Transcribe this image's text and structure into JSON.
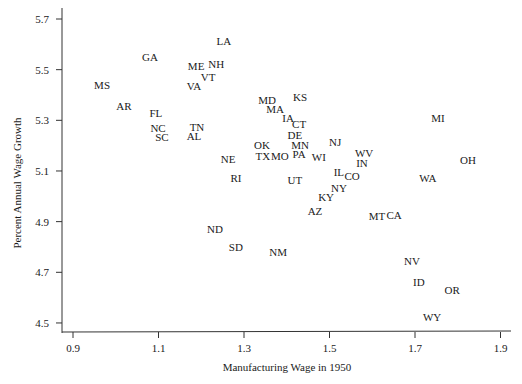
{
  "chart_data": {
    "type": "scatter",
    "title": "",
    "xlabel": "Manufacturing Wage in 1950",
    "ylabel": "Percent Annual Wage Growth",
    "xlim": [
      0.875,
      1.93
    ],
    "ylim": [
      4.46,
      5.74
    ],
    "x_ticks": [
      0.9,
      1.1,
      1.3,
      1.5,
      1.7,
      1.9
    ],
    "x_tick_labels": [
      "0.9",
      "1.1",
      "1.3",
      "1.5",
      "1.7",
      "1.9"
    ],
    "y_ticks": [
      5.7,
      5.5,
      5.3,
      5.1,
      4.9,
      4.7,
      4.5
    ],
    "y_tick_labels": [
      "5.7",
      "5.5",
      "5.3",
      "5.1",
      "4.9",
      "4.7",
      "4.5"
    ],
    "grid": false,
    "legend": null,
    "marker": "state-abbreviation text labels",
    "points": [
      {
        "label": "MS",
        "x": 0.968,
        "y": 5.44
      },
      {
        "label": "AR",
        "x": 1.019,
        "y": 5.357
      },
      {
        "label": "GA",
        "x": 1.08,
        "y": 5.55
      },
      {
        "label": "FL",
        "x": 1.094,
        "y": 5.329
      },
      {
        "label": "NC",
        "x": 1.099,
        "y": 5.27
      },
      {
        "label": "SC",
        "x": 1.108,
        "y": 5.234
      },
      {
        "label": "LA",
        "x": 1.253,
        "y": 5.613
      },
      {
        "label": "ME",
        "x": 1.188,
        "y": 5.514
      },
      {
        "label": "NH",
        "x": 1.235,
        "y": 5.522
      },
      {
        "label": "VT",
        "x": 1.216,
        "y": 5.471
      },
      {
        "label": "VA",
        "x": 1.183,
        "y": 5.435
      },
      {
        "label": "TN",
        "x": 1.19,
        "y": 5.274
      },
      {
        "label": "AL",
        "x": 1.183,
        "y": 5.238
      },
      {
        "label": "NE",
        "x": 1.263,
        "y": 5.147
      },
      {
        "label": "RI",
        "x": 1.281,
        "y": 5.072
      },
      {
        "label": "ND",
        "x": 1.232,
        "y": 4.871
      },
      {
        "label": "SD",
        "x": 1.281,
        "y": 4.8
      },
      {
        "label": "NM",
        "x": 1.38,
        "y": 4.78
      },
      {
        "label": "OK",
        "x": 1.342,
        "y": 5.203
      },
      {
        "label": "TX",
        "x": 1.344,
        "y": 5.159
      },
      {
        "label": "MO",
        "x": 1.384,
        "y": 5.159
      },
      {
        "label": "MD",
        "x": 1.354,
        "y": 5.38
      },
      {
        "label": "MA",
        "x": 1.373,
        "y": 5.345
      },
      {
        "label": "KS",
        "x": 1.431,
        "y": 5.392
      },
      {
        "label": "IA",
        "x": 1.403,
        "y": 5.309
      },
      {
        "label": "CT",
        "x": 1.429,
        "y": 5.285
      },
      {
        "label": "DE",
        "x": 1.419,
        "y": 5.242
      },
      {
        "label": "MN",
        "x": 1.431,
        "y": 5.203
      },
      {
        "label": "PA",
        "x": 1.429,
        "y": 5.167
      },
      {
        "label": "WI",
        "x": 1.475,
        "y": 5.155
      },
      {
        "label": "NJ",
        "x": 1.513,
        "y": 5.214
      },
      {
        "label": "UT",
        "x": 1.419,
        "y": 5.064
      },
      {
        "label": "IL",
        "x": 1.522,
        "y": 5.096
      },
      {
        "label": "CO",
        "x": 1.553,
        "y": 5.08
      },
      {
        "label": "NY",
        "x": 1.522,
        "y": 5.033
      },
      {
        "label": "KY",
        "x": 1.492,
        "y": 4.997
      },
      {
        "label": "AZ",
        "x": 1.466,
        "y": 4.942
      },
      {
        "label": "WV",
        "x": 1.581,
        "y": 5.171
      },
      {
        "label": "IN",
        "x": 1.576,
        "y": 5.132
      },
      {
        "label": "MT",
        "x": 1.611,
        "y": 4.922
      },
      {
        "label": "CA",
        "x": 1.651,
        "y": 4.926
      },
      {
        "label": "MI",
        "x": 1.754,
        "y": 5.309
      },
      {
        "label": "OH",
        "x": 1.824,
        "y": 5.143
      },
      {
        "label": "WA",
        "x": 1.73,
        "y": 5.072
      },
      {
        "label": "NV",
        "x": 1.693,
        "y": 4.745
      },
      {
        "label": "ID",
        "x": 1.709,
        "y": 4.662
      },
      {
        "label": "OR",
        "x": 1.787,
        "y": 4.63
      },
      {
        "label": "WY",
        "x": 1.74,
        "y": 4.524
      }
    ]
  },
  "colors": {
    "background": "#ffffff",
    "axis": "#333333",
    "text": "#1a1a1a"
  }
}
